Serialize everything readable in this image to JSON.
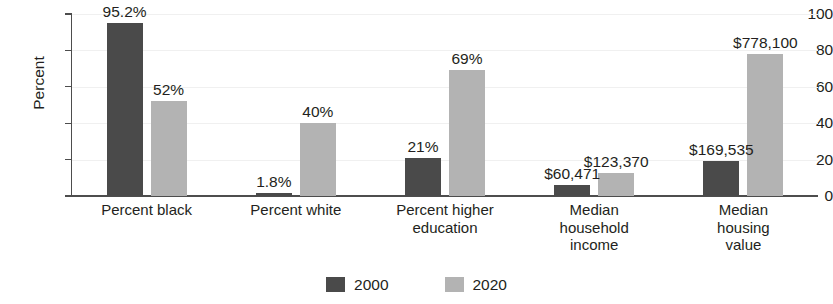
{
  "chart_data": {
    "type": "bar",
    "title": "",
    "xlabel": "",
    "ylabel": "Percent",
    "ylim": [
      0,
      100
    ],
    "yticks": [
      0,
      20,
      40,
      60,
      80,
      100
    ],
    "ytick_labels": [
      "0",
      "20",
      "40",
      "60",
      "80",
      "100"
    ],
    "grid": true,
    "legend_position": "bottom-center",
    "categories": [
      "Percent black",
      "Percent white",
      "Percent higher education",
      "Median household income",
      "Median housing value"
    ],
    "category_lines": [
      [
        "Percent black"
      ],
      [
        "Percent white"
      ],
      [
        "Percent higher",
        "education"
      ],
      [
        "Median",
        "household",
        "income"
      ],
      [
        "Median",
        "housing",
        "value"
      ]
    ],
    "series": [
      {
        "name": "2000",
        "color": "#4a4a4a",
        "values": [
          95.2,
          1.8,
          21,
          60471,
          169535
        ],
        "plotted": [
          95.2,
          1.8,
          21,
          6.1,
          19.0
        ],
        "labels": [
          "95.2%",
          "1.8%",
          "21%",
          "$60,471",
          "$169,535"
        ]
      },
      {
        "name": "2020",
        "color": "#b3b3b3",
        "values": [
          52,
          40,
          69,
          123370,
          778100
        ],
        "plotted": [
          52,
          40,
          69,
          12.6,
          78.0
        ],
        "labels": [
          "52%",
          "40%",
          "69%",
          "$123,370",
          "$778,100"
        ]
      }
    ]
  },
  "axis": {
    "y_title": "Percent"
  },
  "legend": {
    "items": [
      {
        "label": "2000",
        "color": "#4a4a4a"
      },
      {
        "label": "2020",
        "color": "#b3b3b3"
      }
    ]
  },
  "colors": {
    "series_2000": "#4a4a4a",
    "series_2020": "#b3b3b3",
    "axis": "#4d4d4d",
    "text": "#231f20",
    "grid": "#f0f0f0",
    "background": "#ffffff"
  }
}
